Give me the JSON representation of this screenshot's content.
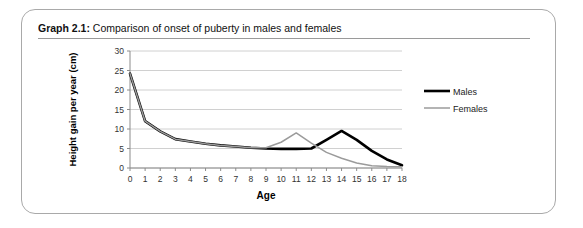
{
  "caption": {
    "label": "Graph 2.1:",
    "text": " Comparison of onset of puberty in males and females"
  },
  "chart_data": {
    "type": "line",
    "title": "Comparison of onset of puberty in males and females",
    "xlabel": "Age",
    "ylabel": "Height gain per year (cm)",
    "xlim": [
      0,
      18
    ],
    "ylim": [
      0,
      30
    ],
    "xticks": [
      0,
      1,
      2,
      3,
      4,
      5,
      6,
      7,
      8,
      9,
      10,
      11,
      12,
      13,
      14,
      15,
      16,
      17,
      18
    ],
    "yticks": [
      0,
      5,
      10,
      15,
      20,
      25,
      30
    ],
    "xtick_labels": [
      "0",
      "1",
      "2",
      "3",
      "4",
      "5",
      "6",
      "7",
      "8",
      "9",
      "10",
      "11",
      "12",
      "13",
      "14",
      "15",
      "16",
      "17",
      "18"
    ],
    "ytick_labels": [
      "0",
      "5",
      "10",
      "15",
      "20",
      "25",
      "30"
    ],
    "grid": true,
    "grid_axis": "y",
    "legend_position": "right",
    "x": [
      0,
      1,
      2,
      3,
      4,
      5,
      6,
      7,
      8,
      9,
      10,
      11,
      12,
      13,
      14,
      15,
      16,
      17,
      18
    ],
    "series": [
      {
        "name": "Males",
        "color": "#000000",
        "width": 2.6,
        "values": [
          24.2,
          12.0,
          9.4,
          7.4,
          6.8,
          6.2,
          5.8,
          5.5,
          5.2,
          5.0,
          4.9,
          4.9,
          5.0,
          7.2,
          9.5,
          7.2,
          4.4,
          2.2,
          0.7
        ]
      },
      {
        "name": "Females",
        "color": "#9b9b9b",
        "width": 1.5,
        "values": [
          24.2,
          12.0,
          9.4,
          7.4,
          6.8,
          6.2,
          5.8,
          5.5,
          5.2,
          5.2,
          6.6,
          9.0,
          6.4,
          4.0,
          2.5,
          1.3,
          0.6,
          0.4,
          0.3
        ]
      }
    ]
  }
}
